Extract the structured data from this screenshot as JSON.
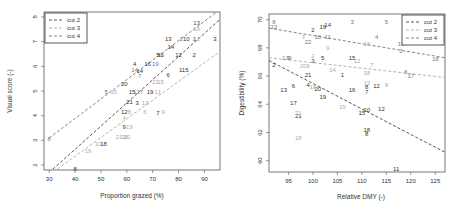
{
  "chart_data": [
    {
      "type": "scatter",
      "title": "",
      "xlabel": "Proportion grazed (%)",
      "ylabel": "Visual score (-)",
      "xlim": [
        28,
        96
      ],
      "ylim": [
        1.8,
        8.2
      ],
      "xticks": [
        30,
        40,
        50,
        60,
        70,
        80,
        90
      ],
      "yticks": [
        2,
        3,
        4,
        5,
        6,
        7,
        8
      ],
      "grid": false,
      "legend_position": "top-left",
      "legend": [
        {
          "name": "cut 2",
          "color": "#444444"
        },
        {
          "name": "cut 3",
          "color": "#aaaaaa"
        },
        {
          "name": "cut 4",
          "color": "#777777"
        }
      ],
      "lines": [
        {
          "name": "cut 2",
          "color": "#444444",
          "x": [
            30,
            96
          ],
          "y": [
            1.7,
            7.9
          ]
        },
        {
          "name": "cut 3",
          "color": "#aaaaaa",
          "x": [
            30,
            96
          ],
          "y": [
            1.6,
            6.6
          ]
        },
        {
          "name": "cut 4",
          "color": "#777777",
          "x": [
            30,
            96
          ],
          "y": [
            3.1,
            8.3
          ]
        }
      ],
      "series": [
        {
          "name": "cut 2",
          "color": "#333333",
          "points": [
            {
              "label": "8",
              "x": 40,
              "y": 1.85
            },
            {
              "label": "18",
              "x": 51,
              "y": 2.85
            },
            {
              "label": "9",
              "x": 59,
              "y": 3.55
            },
            {
              "label": "12",
              "x": 59,
              "y": 4.15
            },
            {
              "label": "21",
              "x": 61,
              "y": 4.55
            },
            {
              "label": "3",
              "x": 64,
              "y": 4.5
            },
            {
              "label": "15",
              "x": 62,
              "y": 4.95
            },
            {
              "label": "19",
              "x": 69,
              "y": 4.95
            },
            {
              "label": "7",
              "x": 72,
              "y": 4.1
            },
            {
              "label": "20",
              "x": 59,
              "y": 5.3
            },
            {
              "label": "6",
              "x": 76,
              "y": 5.65
            },
            {
              "label": "115",
              "x": 82,
              "y": 5.85
            },
            {
              "label": "4",
              "x": 63,
              "y": 6.1
            },
            {
              "label": "14",
              "x": 65,
              "y": 5.8
            },
            {
              "label": "16",
              "x": 68,
              "y": 6.1
            },
            {
              "label": "5",
              "x": 72,
              "y": 6.45
            },
            {
              "label": "11",
              "x": 73,
              "y": 6.45
            },
            {
              "label": "12",
              "x": 80,
              "y": 6.45
            },
            {
              "label": "2",
              "x": 86,
              "y": 6.45
            },
            {
              "label": "13",
              "x": 76,
              "y": 7.1
            },
            {
              "label": "14",
              "x": 77,
              "y": 6.8
            },
            {
              "label": "10",
              "x": 83,
              "y": 7.1
            },
            {
              "label": "3",
              "x": 94,
              "y": 7.1
            }
          ]
        },
        {
          "name": "cut 3",
          "color": "#aaaaaa",
          "points": [
            {
              "label": "19",
              "x": 45,
              "y": 2.55
            },
            {
              "label": "10",
              "x": 49,
              "y": 2.85
            },
            {
              "label": "21",
              "x": 57,
              "y": 3.15
            },
            {
              "label": "18",
              "x": 59,
              "y": 3.15
            },
            {
              "label": "20",
              "x": 60,
              "y": 3.15
            },
            {
              "label": "19",
              "x": 61,
              "y": 3.55
            },
            {
              "label": "4",
              "x": 59,
              "y": 3.9
            },
            {
              "label": "8",
              "x": 61,
              "y": 4.15
            },
            {
              "label": "6",
              "x": 67,
              "y": 4.15
            },
            {
              "label": "9",
              "x": 74,
              "y": 4.15
            },
            {
              "label": "15",
              "x": 55,
              "y": 4.95
            },
            {
              "label": "13",
              "x": 67,
              "y": 4.5
            },
            {
              "label": "11",
              "x": 72,
              "y": 4.95
            },
            {
              "label": "21",
              "x": 71,
              "y": 5.35
            },
            {
              "label": "15",
              "x": 73,
              "y": 5.35
            },
            {
              "label": "16",
              "x": 87,
              "y": 7.5
            },
            {
              "label": "12",
              "x": 87,
              "y": 7.1
            },
            {
              "label": "17",
              "x": 87,
              "y": 7.75
            }
          ]
        },
        {
          "name": "cut 4",
          "color": "#777777",
          "points": [
            {
              "label": "8",
              "x": 30,
              "y": 3.05
            },
            {
              "label": "5",
              "x": 52,
              "y": 4.95
            },
            {
              "label": "7",
              "x": 65,
              "y": 5.6
            },
            {
              "label": "14",
              "x": 63,
              "y": 5.85
            },
            {
              "label": "17",
              "x": 65,
              "y": 4.95
            },
            {
              "label": "1",
              "x": 63,
              "y": 4.95
            },
            {
              "label": "19",
              "x": 71,
              "y": 6.1
            },
            {
              "label": "20",
              "x": 73,
              "y": 6.45
            },
            {
              "label": "2",
              "x": 81,
              "y": 7.1
            },
            {
              "label": "1",
              "x": 86,
              "y": 7.1
            },
            {
              "label": "13",
              "x": 87,
              "y": 7.75
            }
          ]
        }
      ]
    },
    {
      "type": "scatter",
      "title": "",
      "xlabel": "Relative DMY (-)",
      "ylabel": "Digestibility (%)",
      "xlim": [
        91,
        127
      ],
      "ylim": [
        59.2,
        70.4
      ],
      "xticks": [
        95,
        100,
        105,
        110,
        115,
        120,
        125
      ],
      "yticks": [
        60,
        62,
        64,
        66,
        68,
        70
      ],
      "grid": false,
      "legend_position": "top-right",
      "legend": [
        {
          "name": "cut 2",
          "color": "#444444"
        },
        {
          "name": "cut 3",
          "color": "#aaaaaa"
        },
        {
          "name": "cut 4",
          "color": "#777777"
        }
      ],
      "lines": [
        {
          "name": "cut 2",
          "color": "#444444",
          "x": [
            91,
            127
          ],
          "y": [
            67.1,
            60.6
          ]
        },
        {
          "name": "cut 3",
          "color": "#aaaaaa",
          "x": [
            91,
            127
          ],
          "y": [
            67.3,
            65.9
          ]
        },
        {
          "name": "cut 4",
          "color": "#777777",
          "x": [
            91,
            127
          ],
          "y": [
            69.4,
            67.3
          ]
        }
      ],
      "series": [
        {
          "name": "cut 2",
          "color": "#333333",
          "points": [
            {
              "label": "2",
              "x": 92,
              "y": 66.8
            },
            {
              "label": "13",
              "x": 94,
              "y": 65.0
            },
            {
              "label": "6",
              "x": 96,
              "y": 65.3
            },
            {
              "label": "17",
              "x": 96,
              "y": 64.1
            },
            {
              "label": "21",
              "x": 97,
              "y": 63.2
            },
            {
              "label": "21",
              "x": 99,
              "y": 66.1
            },
            {
              "label": "4",
              "x": 99,
              "y": 65.4
            },
            {
              "label": "20",
              "x": 101,
              "y": 65.1
            },
            {
              "label": "19",
              "x": 102,
              "y": 64.5
            },
            {
              "label": "3",
              "x": 100,
              "y": 67.1
            },
            {
              "label": "5",
              "x": 102,
              "y": 67.3
            },
            {
              "label": "2",
              "x": 100,
              "y": 69.3
            },
            {
              "label": "19",
              "x": 102,
              "y": 69.5
            },
            {
              "label": "14",
              "x": 103,
              "y": 69.6
            },
            {
              "label": "9",
              "x": 95,
              "y": 67.3
            },
            {
              "label": "1",
              "x": 106,
              "y": 66.1
            },
            {
              "label": "16",
              "x": 108,
              "y": 65.0
            },
            {
              "label": "15",
              "x": 110,
              "y": 63.4
            },
            {
              "label": "10",
              "x": 111,
              "y": 63.6
            },
            {
              "label": "8",
              "x": 111,
              "y": 65.2
            },
            {
              "label": "7",
              "x": 111,
              "y": 64.9
            },
            {
              "label": "12",
              "x": 113,
              "y": 65.3
            },
            {
              "label": "12",
              "x": 114,
              "y": 63.7
            },
            {
              "label": "18",
              "x": 111,
              "y": 62.2
            },
            {
              "label": "8",
              "x": 111,
              "y": 61.9
            },
            {
              "label": "11",
              "x": 117,
              "y": 59.4
            },
            {
              "label": "15",
              "x": 108,
              "y": 67.3
            }
          ]
        },
        {
          "name": "cut 3",
          "color": "#aaaaaa",
          "points": [
            {
              "label": "18",
              "x": 97,
              "y": 61.6
            },
            {
              "label": "21",
              "x": 97,
              "y": 63.4
            },
            {
              "label": "16",
              "x": 100,
              "y": 65.2
            },
            {
              "label": "2",
              "x": 100,
              "y": 67.4
            },
            {
              "label": "3",
              "x": 98,
              "y": 68.8
            },
            {
              "label": "9",
              "x": 103,
              "y": 68.0
            },
            {
              "label": "14",
              "x": 104,
              "y": 66.4
            },
            {
              "label": "19",
              "x": 106,
              "y": 63.8
            },
            {
              "label": "12",
              "x": 109,
              "y": 67.1
            },
            {
              "label": "18",
              "x": 111,
              "y": 66.2
            },
            {
              "label": "13",
              "x": 111,
              "y": 65.5
            },
            {
              "label": "9",
              "x": 115,
              "y": 65.4
            },
            {
              "label": "7",
              "x": 112,
              "y": 66.8
            },
            {
              "label": "16",
              "x": 111,
              "y": 68.3
            },
            {
              "label": "19",
              "x": 95,
              "y": 67.3
            },
            {
              "label": "20",
              "x": 98,
              "y": 66.7
            },
            {
              "label": "6",
              "x": 99,
              "y": 66.7
            }
          ]
        },
        {
          "name": "cut 4",
          "color": "#777777",
          "points": [
            {
              "label": "8",
              "x": 92,
              "y": 69.8
            },
            {
              "label": "13",
              "x": 92,
              "y": 69.5
            },
            {
              "label": "5",
              "x": 115,
              "y": 69.8
            },
            {
              "label": "3",
              "x": 108,
              "y": 69.8
            },
            {
              "label": "4",
              "x": 113,
              "y": 68.8
            },
            {
              "label": "22",
              "x": 99,
              "y": 68.4
            },
            {
              "label": "10",
              "x": 101,
              "y": 68.8
            },
            {
              "label": "11",
              "x": 103,
              "y": 68.8
            },
            {
              "label": "19",
              "x": 118,
              "y": 68.3
            },
            {
              "label": "2",
              "x": 118,
              "y": 67.8
            },
            {
              "label": "18",
              "x": 125,
              "y": 67.2
            },
            {
              "label": "6",
              "x": 119,
              "y": 66.3
            },
            {
              "label": "17",
              "x": 120,
              "y": 66.0
            },
            {
              "label": "1",
              "x": 94,
              "y": 67.3
            }
          ]
        }
      ]
    }
  ]
}
